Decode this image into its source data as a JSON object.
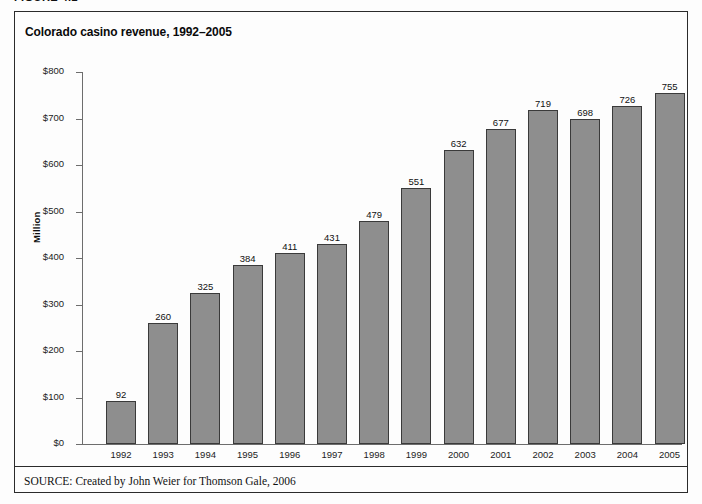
{
  "figure_tag": "FIGURE 4.2",
  "title": "Colorado casino revenue, 1992–2005",
  "source": {
    "label": "SOURCE:",
    "text": " Created by John Weier for Thomson Gale, 2006"
  },
  "colors": {
    "bar_fill": "#8e8e8e",
    "bar_stroke": "#3a3a3a",
    "axis": "#6d6d6d",
    "frame": "#2b2b2b",
    "text": "#111111",
    "background": "#fdfdfd"
  },
  "chart_data": {
    "type": "bar",
    "title": "Colorado casino revenue, 1992–2005",
    "xlabel": "",
    "ylabel": "Million",
    "ylim": [
      0,
      800
    ],
    "ytick_step": 100,
    "ytick_labels": [
      "$0",
      "$100",
      "$200",
      "$300",
      "$400",
      "$500",
      "$600",
      "$700",
      "$800"
    ],
    "ytick_values": [
      0,
      100,
      200,
      300,
      400,
      500,
      600,
      700,
      800
    ],
    "grid": false,
    "legend": false,
    "value_labels": true,
    "categories": [
      "1992",
      "1993",
      "1994",
      "1995",
      "1996",
      "1997",
      "1998",
      "1999",
      "2000",
      "2001",
      "2002",
      "2003",
      "2004",
      "2005"
    ],
    "values": [
      92,
      260,
      325,
      384,
      411,
      431,
      479,
      551,
      632,
      677,
      719,
      698,
      726,
      755
    ]
  }
}
